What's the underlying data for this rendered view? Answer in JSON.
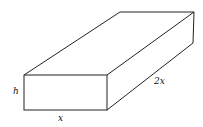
{
  "diagram": {
    "type": "rectangular-box",
    "labels": {
      "height": "h",
      "width": "x",
      "length": "2x"
    },
    "stroke_color": "#222222"
  }
}
